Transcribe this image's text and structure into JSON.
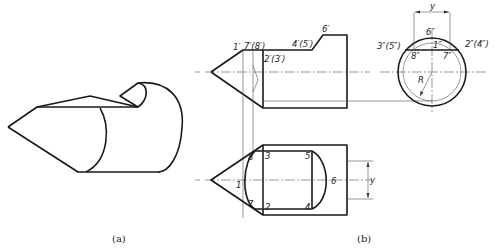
{
  "figure": {
    "caption_a": "(a)",
    "caption_b": "(b)"
  },
  "front_view": {
    "labels": {
      "p1": "1′",
      "p7_8": "7′(8′)",
      "p2_3": "2′(3′)",
      "p4_5": "4′(5′)",
      "p6": "6′"
    }
  },
  "side_view": {
    "labels": {
      "y_dim": "y",
      "p6": "6″",
      "p3_5": "3″(5″)",
      "p1": "1″",
      "p2_4": "2″(4″)",
      "p8": "8″",
      "p7": "7″",
      "radius": "R"
    }
  },
  "top_view": {
    "labels": {
      "p8": "8",
      "p3": "3",
      "p5": "5",
      "p1": "1",
      "p6": "6",
      "p7": "7",
      "p2": "2",
      "p4": "4",
      "y_dim": "y"
    }
  },
  "colors": {
    "line": "#1a1a1a",
    "thin_line": "#555555",
    "background": "#ffffff"
  }
}
